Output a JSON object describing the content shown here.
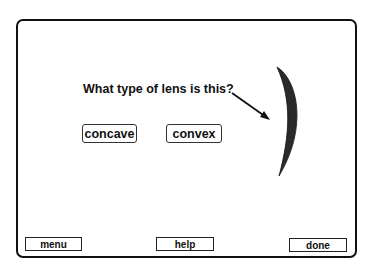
{
  "question": "What type of lens is this?",
  "choices": [
    {
      "label": "concave"
    },
    {
      "label": "convex"
    }
  ],
  "nav": {
    "menu": "menu",
    "help": "help",
    "done": "done"
  },
  "illustration": {
    "name": "lens-image",
    "color": "#2a2a2a",
    "pointer": "arrow pointing at lens"
  }
}
